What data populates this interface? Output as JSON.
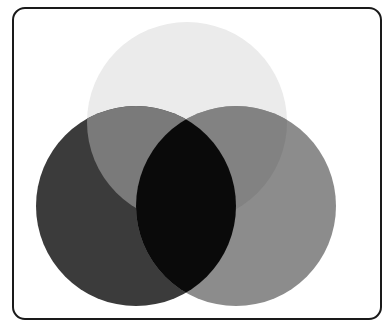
{
  "diagram": {
    "type": "venn",
    "set_count": 3,
    "frame": {
      "border_color": "#1a1a1a",
      "corner_radius": 13
    },
    "circles": [
      {
        "id": "top",
        "cx": 187,
        "cy": 122,
        "r": 100,
        "fill": "#ebebeb"
      },
      {
        "id": "left",
        "cx": 136,
        "cy": 206,
        "r": 100,
        "fill": "#3b3b3b"
      },
      {
        "id": "right",
        "cx": 236,
        "cy": 206,
        "r": 100,
        "fill": "#8c8c8c"
      }
    ],
    "overlap_colors": {
      "top_left": "#7a7a7a",
      "top_right": "#828282",
      "left_right": "#0a0a0a",
      "all_three": "#0a0a0a"
    },
    "labels": []
  }
}
